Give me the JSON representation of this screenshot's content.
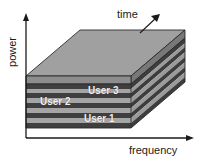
{
  "figure": {
    "background": "#ffffff"
  },
  "axes": {
    "vertical": {
      "label": "power",
      "icon": "arrow-up-icon",
      "color": "#1a1a1a"
    },
    "horizontal": {
      "label": "frequency",
      "icon": "arrow-right-icon",
      "color": "#1a1a1a"
    },
    "depth": {
      "label": "time",
      "icon": "arrow-diagonal-up-right-icon",
      "color": "#1a1a1a"
    }
  },
  "layers": [
    {
      "label": "User 3",
      "text_color": "#f2f2f2"
    },
    {
      "label": "User 2",
      "text_color": "#f2f2f2"
    },
    {
      "label": "User 1",
      "text_color": "#f2f2f2"
    }
  ],
  "colors": {
    "slab_top_light": "#a3a3a3",
    "slab_top_dark": "#4a4a4a",
    "slab_side_light": "#8f8f8f",
    "slab_side_dark": "#3d3d3d",
    "slab_front_light": "#9a9a9a",
    "slab_front_dark": "#434343",
    "top_face": "#a0a0a0",
    "top_face_side": "#8a8a8a",
    "outline": "#2b2b2b",
    "axis": "#1a1a1a"
  }
}
